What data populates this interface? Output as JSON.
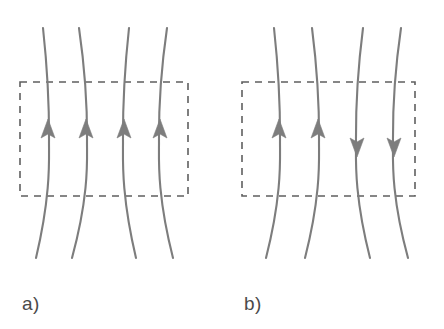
{
  "figure": {
    "background_color": "#ffffff",
    "width": 444,
    "height": 329,
    "line_color": "#7d7d7d",
    "arrow_color": "#7d7d7d",
    "dash_color": "#5f5f5f",
    "label_color": "#4a4a4a",
    "line_width": 2.1,
    "dash_width": 1.6,
    "dash_pattern": "7 6"
  },
  "panels": [
    {
      "id": "panel-a",
      "label": "a)",
      "label_x": 22,
      "label_y": 310,
      "box": {
        "x": 20,
        "y": 82,
        "width": 168,
        "height": 114
      },
      "field_lines": [
        {
          "id": "line-a1",
          "top_x": 43,
          "mid_x": 49,
          "bottom_x": 36,
          "arrow_x": 48,
          "arrow_y": 138,
          "direction": "up"
        },
        {
          "id": "line-a2",
          "top_x": 79,
          "mid_x": 87,
          "bottom_x": 72,
          "arrow_x": 86,
          "arrow_y": 138,
          "direction": "up"
        },
        {
          "id": "line-a3",
          "top_x": 129,
          "mid_x": 123,
          "bottom_x": 136,
          "arrow_x": 124,
          "arrow_y": 138,
          "direction": "up"
        },
        {
          "id": "line-a4",
          "top_x": 167,
          "mid_x": 159,
          "bottom_x": 173,
          "arrow_x": 160,
          "arrow_y": 138,
          "direction": "up"
        }
      ]
    },
    {
      "id": "panel-b",
      "label": "b)",
      "label_x": 244,
      "label_y": 310,
      "box": {
        "x": 242,
        "y": 82,
        "width": 173,
        "height": 114
      },
      "field_lines": [
        {
          "id": "line-b1",
          "top_x": 274,
          "mid_x": 280,
          "bottom_x": 266,
          "arrow_x": 279,
          "arrow_y": 138,
          "direction": "up"
        },
        {
          "id": "line-b2",
          "top_x": 312,
          "mid_x": 319,
          "bottom_x": 305,
          "arrow_x": 318,
          "arrow_y": 138,
          "direction": "up"
        },
        {
          "id": "line-b3",
          "top_x": 363,
          "mid_x": 356,
          "bottom_x": 370,
          "arrow_x": 357,
          "arrow_y": 138,
          "direction": "down"
        },
        {
          "id": "line-b4",
          "top_x": 401,
          "mid_x": 393,
          "bottom_x": 408,
          "arrow_x": 394,
          "arrow_y": 138,
          "direction": "down"
        }
      ]
    }
  ],
  "geometry": {
    "line_top_y": 28,
    "line_bottom_y": 258,
    "arrow_half_width": 7,
    "arrow_length": 19
  }
}
